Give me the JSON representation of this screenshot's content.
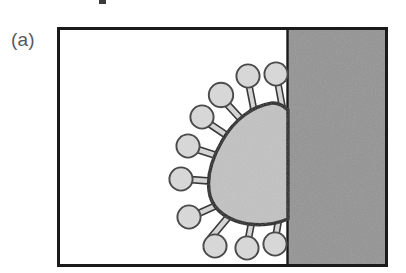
{
  "figure": {
    "panel_label": "(a)",
    "panel_label_color": "#58595b",
    "caption_fragment_top": ""
  },
  "frame": {
    "name": "figure-border",
    "x": 57,
    "y": 27,
    "width": 331,
    "height": 240,
    "stroke_color": "#1a1a1a",
    "stroke_width": 3,
    "fill_color": "#ffffff"
  },
  "regions": [
    {
      "name": "liquid-region",
      "label": "aqueous phase",
      "fill_color": "#ffffff",
      "x": 57,
      "y": 27,
      "width": 230,
      "height": 240
    },
    {
      "name": "solid-surface-region",
      "label": "solid substrate",
      "fill_color": "#949494",
      "x": 287,
      "y": 27,
      "width": 101,
      "height": 240
    }
  ],
  "interface_line": {
    "name": "surface-interface",
    "x": 287,
    "y_top": 27,
    "y_bottom": 267,
    "stroke_color": "#1a1a1a",
    "stroke_width": 2
  },
  "virus": {
    "name": "virus-particle",
    "body_fill": "#c2c2c2",
    "body_stroke": "#1a1a1a",
    "body_stroke_width": 3.4,
    "spike_head_fill": "#d9d9d9",
    "spike_head_stroke": "#3a3a3a",
    "spike_head_stroke_width": 1.8,
    "spike_stem_fill": "#d4d4d4",
    "spike_stem_stroke": "#3a3a3a",
    "spike_stem_stroke_width": 1.5,
    "spike_count": 11,
    "spikes": [
      {
        "id": 1,
        "head_cx": 249,
        "head_cy": 76,
        "head_r": 11.5,
        "base_x": 256,
        "base_y": 112,
        "stem_w": 5.5
      },
      {
        "id": 2,
        "head_cx": 276,
        "head_cy": 74,
        "head_r": 11.5,
        "base_x": 282,
        "base_y": 108,
        "stem_w": 5.5
      },
      {
        "id": 3,
        "head_cx": 222,
        "head_cy": 95,
        "head_r": 12.0,
        "base_x": 243,
        "base_y": 122,
        "stem_w": 5.5
      },
      {
        "id": 4,
        "head_cx": 203,
        "head_cy": 117,
        "head_r": 11.5,
        "base_x": 230,
        "base_y": 137,
        "stem_w": 5.5
      },
      {
        "id": 5,
        "head_cx": 189,
        "head_cy": 145,
        "head_r": 11.5,
        "base_x": 220,
        "base_y": 157,
        "stem_w": 5.5
      },
      {
        "id": 6,
        "head_cx": 182,
        "head_cy": 178,
        "head_r": 11.5,
        "base_x": 215,
        "base_y": 181,
        "stem_w": 5.5
      },
      {
        "id": 7,
        "head_cx": 190,
        "head_cy": 216,
        "head_r": 11.5,
        "base_x": 221,
        "base_y": 203,
        "stem_w": 5.5
      },
      {
        "id": 8,
        "head_cx": 216,
        "head_cy": 247,
        "head_r": 11.5,
        "base_x": 234,
        "base_y": 216,
        "stem_w": 5.5
      },
      {
        "id": 9,
        "head_cx": 248,
        "head_cy": 249,
        "head_r": 11.5,
        "base_x": 253,
        "base_y": 219,
        "stem_w": 5.5
      },
      {
        "id": 10,
        "head_cx": 276,
        "head_cy": 245,
        "head_r": 11.5,
        "base_x": 278,
        "base_y": 214,
        "stem_w": 5.5
      },
      {
        "id": 11,
        "head_cx": 200,
        "head_cy": 100,
        "head_r": 0.0,
        "base_x": 200,
        "base_y": 100,
        "stem_w": 0.0
      }
    ]
  },
  "colors": {
    "ink": "#1a1a1a",
    "label_grey": "#58595b",
    "substrate_grey": "#949494",
    "virus_body_grey": "#c2c2c2",
    "spike_grey": "#d9d9d9",
    "background": "#ffffff"
  }
}
